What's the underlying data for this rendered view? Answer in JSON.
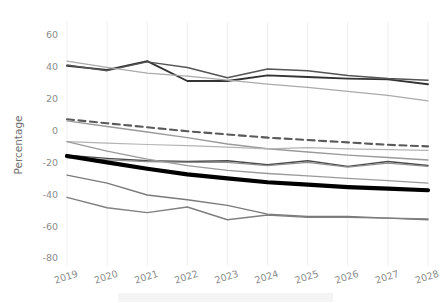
{
  "chart_data": {
    "type": "line",
    "title": "",
    "subtitle": "",
    "xlabel": "",
    "ylabel": "Percentage",
    "x": [
      2019,
      2020,
      2021,
      2022,
      2023,
      2024,
      2025,
      2026,
      2027,
      2028
    ],
    "categories": [
      "2019",
      "2020",
      "2021",
      "2022",
      "2023",
      "2024",
      "2025",
      "2026",
      "2027",
      "2028"
    ],
    "xtick_labels": [
      "2019",
      "2020",
      "2021",
      "2022",
      "2023",
      "2024",
      "2025",
      "2026",
      "2027",
      "2028"
    ],
    "ytick_labels": [
      "60",
      "40",
      "20",
      "0",
      "-20",
      "-40",
      "-60",
      "-80"
    ],
    "ytick_values": [
      60,
      40,
      20,
      0,
      -20,
      -40,
      -60,
      -80
    ],
    "ylim": [
      -85,
      68
    ],
    "xlim": [
      2019,
      2028
    ],
    "grid": "vertical-only",
    "legend": "none-visible",
    "series": [
      {
        "name": "upper-dark-a",
        "color": "#333333",
        "width": 1.9,
        "style": "solid",
        "values": [
          40.5,
          38.0,
          43.5,
          31.0,
          31.0,
          34.5,
          33.5,
          32.5,
          32.0,
          29.0
        ]
      },
      {
        "name": "upper-dark-b",
        "color": "#555555",
        "width": 1.5,
        "style": "solid",
        "values": [
          41.0,
          37.5,
          43.0,
          39.5,
          33.0,
          38.5,
          37.5,
          34.5,
          32.5,
          31.5
        ]
      },
      {
        "name": "upper-gray-fade",
        "color": "#aaaaaa",
        "width": 1.3,
        "style": "solid",
        "values": [
          43.5,
          39.5,
          36.0,
          34.0,
          31.5,
          29.0,
          27.0,
          24.5,
          22.0,
          18.5
        ]
      },
      {
        "name": "dashed-projection",
        "color": "#5a5a5a",
        "width": 2.1,
        "style": "dashed",
        "values": [
          7.0,
          4.5,
          2.0,
          -0.5,
          -2.5,
          -4.5,
          -6.0,
          -7.5,
          -9.0,
          -10.0
        ]
      },
      {
        "name": "mid-gray-steep",
        "color": "#9a9a9a",
        "width": 1.4,
        "style": "solid",
        "values": [
          6.0,
          2.5,
          -1.0,
          -4.5,
          -8.5,
          -11.5,
          -13.5,
          -15.5,
          -17.0,
          -18.5
        ]
      },
      {
        "name": "mid-gray-shallow",
        "color": "#b4b4b4",
        "width": 1.2,
        "style": "solid",
        "values": [
          -7.0,
          -8.0,
          -8.8,
          -9.5,
          -10.5,
          -11.5,
          -10.8,
          -11.5,
          -12.0,
          -12.5
        ]
      },
      {
        "name": "cluster-dark-wavy",
        "color": "#4a4a4a",
        "width": 1.4,
        "style": "solid",
        "values": [
          -15.5,
          -17.5,
          -19.0,
          -19.5,
          -19.0,
          -21.5,
          -19.0,
          -22.5,
          -19.5,
          -22.0
        ]
      },
      {
        "name": "cluster-gray-wavy",
        "color": "#8f8f8f",
        "width": 1.3,
        "style": "solid",
        "values": [
          -17.0,
          -18.5,
          -19.5,
          -20.0,
          -20.0,
          -22.0,
          -20.0,
          -23.0,
          -20.5,
          -22.5
        ]
      },
      {
        "name": "bold-median",
        "color": "#000000",
        "width": 4.2,
        "style": "solid",
        "values": [
          -16.0,
          -20.0,
          -24.0,
          -27.5,
          -30.0,
          -32.5,
          -34.0,
          -35.5,
          -36.5,
          -37.5
        ]
      },
      {
        "name": "lower-gray-a",
        "color": "#9a9a9a",
        "width": 1.3,
        "style": "solid",
        "values": [
          -7.0,
          -13.0,
          -18.0,
          -22.0,
          -25.0,
          -27.0,
          -28.5,
          -30.0,
          -31.5,
          -33.0
        ]
      },
      {
        "name": "lower-gray-b",
        "color": "#7a7a7a",
        "width": 1.4,
        "style": "solid",
        "values": [
          -28.0,
          -33.0,
          -40.5,
          -43.5,
          -47.0,
          -52.5,
          -54.0,
          -54.0,
          -55.0,
          -56.0
        ]
      },
      {
        "name": "lower-gray-c",
        "color": "#7f7f7f",
        "width": 1.4,
        "style": "solid",
        "values": [
          -42.0,
          -48.5,
          -51.5,
          -48.0,
          -56.0,
          -53.0,
          -54.5,
          -54.5,
          -55.0,
          -55.5
        ]
      }
    ]
  },
  "axes": {
    "y_axis_title": "Percentage"
  }
}
